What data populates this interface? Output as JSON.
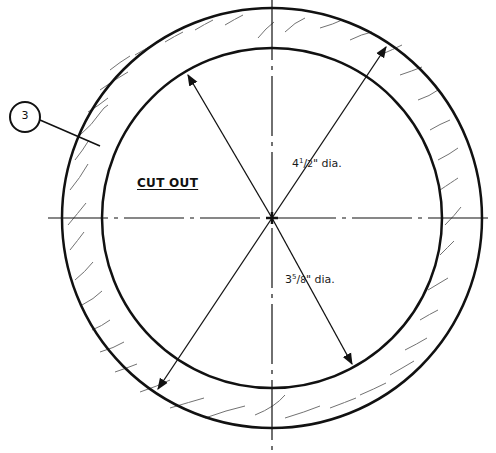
{
  "diagram": {
    "part_callout": "3",
    "region_label": "CUT OUT",
    "dimensions": [
      {
        "whole": "4",
        "num": "1",
        "den": "2",
        "suffix": "\" dia.",
        "refers_to": "outer circle diameter"
      },
      {
        "whole": "3",
        "num": "5",
        "den": "8",
        "suffix": "\" dia.",
        "refers_to": "inner circle diameter"
      }
    ],
    "stroke_color": "#111111",
    "background": "#ffffff"
  }
}
